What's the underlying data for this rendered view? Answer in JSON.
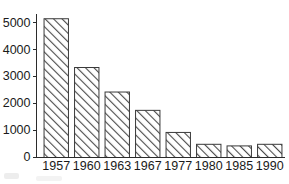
{
  "chart_data": {
    "type": "bar",
    "title": "",
    "subtitle": "",
    "xlabel": "",
    "ylabel": "",
    "categories": [
      "1957",
      "1960",
      "1963",
      "1967",
      "1977",
      "1980",
      "1985",
      "1990"
    ],
    "values": [
      5150,
      3340,
      2430,
      1750,
      930,
      490,
      430,
      490
    ],
    "series": [
      {
        "name": "",
        "values": [
          5150,
          3340,
          2430,
          1750,
          930,
          490,
          430,
          490
        ]
      }
    ],
    "ylim": [
      0,
      5400
    ],
    "xlim": [
      0,
      8
    ],
    "ytick_labels": [
      "0",
      "1000",
      "2000",
      "3000",
      "4000",
      "5000"
    ],
    "ytick_values": [
      0,
      1000,
      2000,
      3000,
      4000,
      5000
    ],
    "xtick_labels": [
      "1957",
      "1960",
      "1963",
      "1967",
      "1977",
      "1980",
      "1985",
      "1990"
    ],
    "grid": false,
    "legend": null,
    "legend_position": "none",
    "bar_fill": "diagonal-hatch",
    "bar_fill_color": "#ffffff",
    "bar_hatch_color": "#4a4a4a",
    "bar_edge_color": "#3a3a3a",
    "axis_color": "#2b2b2b",
    "background_color": "#ffffff",
    "text_color": "#1a1a1a",
    "annotations": []
  },
  "figure": {
    "width_px": 289,
    "height_px": 184
  }
}
